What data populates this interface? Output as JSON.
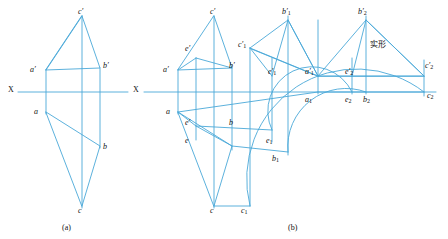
{
  "figure": {
    "caption_a": "(a)",
    "caption_b": "(b)",
    "axis_label_a": "X",
    "axis_label_b": "X",
    "note_cn": "实形",
    "colors": {
      "line": "#4aa8d8",
      "axis": "#4aa8d8",
      "text": "#111111",
      "background": "#ffffff"
    }
  },
  "panel_a": {
    "labels": [
      {
        "id": "a-cp",
        "text": "c",
        "prime": "′",
        "x": 78,
        "y": 8
      },
      {
        "id": "a-ap",
        "text": "a",
        "prime": "′",
        "x": 36,
        "y": 70
      },
      {
        "id": "a-bp",
        "text": "b",
        "prime": "′",
        "x": 105,
        "y": 66
      },
      {
        "id": "a-X",
        "text": "X",
        "prime": "",
        "x": 10,
        "y": 89
      },
      {
        "id": "a-a",
        "text": "a",
        "prime": "",
        "x": 36,
        "y": 110
      },
      {
        "id": "a-b",
        "text": "b",
        "prime": "",
        "x": 104,
        "y": 148
      },
      {
        "id": "a-c",
        "text": "c",
        "prime": "",
        "x": 78,
        "y": 210
      }
    ]
  },
  "panel_b": {
    "labels": [
      {
        "id": "b-cp",
        "text": "c",
        "prime": "′",
        "sub": "",
        "x": 210,
        "y": 8
      },
      {
        "id": "b-b1p",
        "text": "b",
        "prime": "′",
        "sub": "1",
        "x": 284,
        "y": 8
      },
      {
        "id": "b-b2p",
        "text": "b",
        "prime": "′",
        "sub": "2",
        "x": 360,
        "y": 8
      },
      {
        "id": "b-ep",
        "text": "e",
        "prime": "′",
        "sub": "",
        "x": 186,
        "y": 46
      },
      {
        "id": "b-c1p",
        "text": "c",
        "prime": "′",
        "sub": "1",
        "x": 240,
        "y": 44
      },
      {
        "id": "b-cn",
        "text": "实形",
        "prime": "",
        "sub": "",
        "x": 372,
        "y": 44
      },
      {
        "id": "b-ap",
        "text": "a",
        "prime": "′",
        "sub": "",
        "x": 168,
        "y": 70
      },
      {
        "id": "b-bp",
        "text": "b",
        "prime": "′",
        "sub": "",
        "x": 228,
        "y": 66
      },
      {
        "id": "b-e1p",
        "text": "e",
        "prime": "′",
        "sub": "1",
        "x": 272,
        "y": 70
      },
      {
        "id": "b-a1p",
        "text": "a",
        "prime": "′",
        "sub": "1",
        "x": 309,
        "y": 70
      },
      {
        "id": "b-e2p",
        "text": "e",
        "prime": "′",
        "sub": "2",
        "x": 349,
        "y": 70
      },
      {
        "id": "b-c2p",
        "text": "c",
        "prime": "′",
        "sub": "2",
        "x": 424,
        "y": 66
      },
      {
        "id": "b-X",
        "text": "X",
        "prime": "",
        "sub": "",
        "x": 135,
        "y": 89
      },
      {
        "id": "b-a",
        "text": "a",
        "prime": "",
        "sub": "",
        "x": 168,
        "y": 110
      },
      {
        "id": "b-a1",
        "text": "a",
        "prime": "",
        "sub": "1",
        "x": 306,
        "y": 97
      },
      {
        "id": "b-e2",
        "text": "e",
        "prime": "",
        "sub": "2",
        "x": 348,
        "y": 97
      },
      {
        "id": "b-b2",
        "text": "b",
        "prime": "",
        "sub": "2",
        "x": 365,
        "y": 97
      },
      {
        "id": "b-c2",
        "text": "c",
        "prime": "",
        "sub": "2",
        "x": 426,
        "y": 95
      },
      {
        "id": "b-eprime",
        "text": "e",
        "prime": "′",
        "sub": "",
        "x": 186,
        "y": 122
      },
      {
        "id": "b-b",
        "text": "b",
        "prime": "",
        "sub": "",
        "x": 228,
        "y": 122
      },
      {
        "id": "b-e",
        "text": "e",
        "prime": "",
        "sub": "",
        "x": 186,
        "y": 140
      },
      {
        "id": "b-e1",
        "text": "e",
        "prime": "",
        "sub": "1",
        "x": 268,
        "y": 140
      },
      {
        "id": "b-b1",
        "text": "b",
        "prime": "",
        "sub": "1",
        "x": 274,
        "y": 158
      },
      {
        "id": "b-c",
        "text": "c",
        "prime": "",
        "sub": "",
        "x": 210,
        "y": 210
      },
      {
        "id": "b-c1",
        "text": "c",
        "prime": "",
        "sub": "1",
        "x": 243,
        "y": 210
      }
    ]
  }
}
